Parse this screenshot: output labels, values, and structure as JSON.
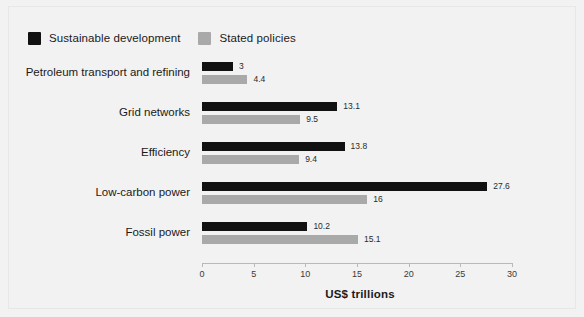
{
  "chart_data": {
    "type": "bar",
    "orientation": "horizontal",
    "title": "",
    "subtitle": "",
    "xlabel": "US$ trillions",
    "ylabel": "",
    "xlim": [
      0,
      30
    ],
    "xticks": [
      "0",
      "5",
      "10",
      "15",
      "20",
      "25",
      "30"
    ],
    "xtick_values": [
      0,
      5,
      10,
      15,
      20,
      25,
      30
    ],
    "grid": false,
    "legend_position": "top-left",
    "categories": [
      "Petroleum transport and refining",
      "Grid networks",
      "Efficiency",
      "Low-carbon power",
      "Fossil power"
    ],
    "series": [
      {
        "name": "Sustainable development",
        "color": "#111111",
        "values": [
          3,
          13.1,
          13.8,
          27.6,
          10.2
        ],
        "labels": [
          "3",
          "13.1",
          "13.8",
          "27.6",
          "10.2"
        ]
      },
      {
        "name": "Stated policies",
        "color": "#a9a9a9",
        "values": [
          4.4,
          9.5,
          9.4,
          16,
          15.1
        ],
        "labels": [
          "4.4",
          "9.5",
          "9.4",
          "16",
          "15.1"
        ]
      }
    ]
  },
  "colors": {
    "background": "#f2f2f2",
    "frame": "#e7e7e7",
    "axis": "#b9b9b9",
    "text": "#1a1a1a",
    "series_0": "#111111",
    "series_1": "#a9a9a9"
  }
}
